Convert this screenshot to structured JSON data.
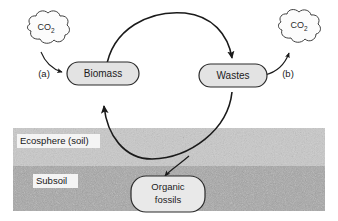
{
  "diagram": {
    "colors": {
      "stroke": "#1a1a1a",
      "node_fill": "#e3e3e3",
      "cloud_fill": "#fbfbfb",
      "ecosphere_band": "#c9c9c9",
      "subsoil_band": "#a9a9a9",
      "label_bg": "#f2f2f2",
      "background": "#ffffff"
    },
    "nodes": [
      {
        "id": "biomass",
        "label": "Biomass",
        "shape": "rounded-rect"
      },
      {
        "id": "wastes",
        "label": "Wastes",
        "shape": "rounded-rect"
      },
      {
        "id": "organic-fossils",
        "label_line1": "Organic",
        "label_line2": "fossils",
        "shape": "rounded-rect"
      }
    ],
    "clouds": [
      {
        "id": "co2-left",
        "formula": "CO",
        "subscript": "2"
      },
      {
        "id": "co2-right",
        "formula": "CO",
        "subscript": "2"
      }
    ],
    "markers": [
      {
        "id": "marker-a",
        "label": "(a)"
      },
      {
        "id": "marker-b",
        "label": "(b)"
      }
    ],
    "bands": [
      {
        "id": "ecosphere",
        "label": "Ecosphere (soil)"
      },
      {
        "id": "subsoil",
        "label": "Subsoil"
      }
    ],
    "flows": [
      {
        "id": "co2-to-biomass",
        "from": "co2-left",
        "to": "biomass",
        "marker": "(a)"
      },
      {
        "id": "biomass-to-wastes",
        "from": "biomass",
        "to": "wastes"
      },
      {
        "id": "wastes-to-co2",
        "from": "wastes",
        "to": "co2-right",
        "marker": "(b)"
      },
      {
        "id": "wastes-to-biomass",
        "from": "wastes",
        "to": "biomass"
      },
      {
        "id": "wastes-to-fossils",
        "from": "wastes",
        "to": "organic-fossils"
      }
    ]
  }
}
